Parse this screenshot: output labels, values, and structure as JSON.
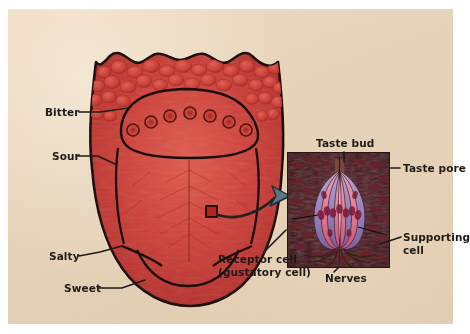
{
  "figure": {
    "panel_color": "#e6d3b9",
    "page_background": "#ffffff"
  },
  "tongue": {
    "name": "tongue-illustration",
    "body_color": "#cb3a34",
    "outline_color": "#1a0c09",
    "papillae_color": "#c94038",
    "marker": {
      "name": "sample-site-marker",
      "color": "#b7221e",
      "x": 211,
      "y": 211,
      "size": 11
    },
    "region_labels": [
      {
        "id": "bitter",
        "label": "Bitter",
        "x": 45,
        "y": 112,
        "leader_to_x": 128,
        "leader_to_y": 109
      },
      {
        "id": "sour",
        "label": "Sour",
        "x": 52,
        "y": 156,
        "leader_to_x": 116,
        "leader_to_y": 164
      },
      {
        "id": "salty",
        "label": "Salty",
        "x": 49,
        "y": 257,
        "leader_to_x": 121,
        "leader_to_y": 246
      },
      {
        "id": "sweet",
        "label": "Sweet",
        "x": 64,
        "y": 290,
        "leader_to_x": 143,
        "leader_to_y": 282
      }
    ]
  },
  "inset": {
    "name": "taste-bud-inset",
    "title": "Taste bud",
    "title_x": 316,
    "title_y": 137,
    "frame": {
      "x": 287,
      "y": 152,
      "width": 103,
      "height": 116
    },
    "background_color": "#3b1418",
    "border_color": "#2a1410",
    "cell_colors": {
      "receptor": "#e98aa0",
      "supporting": "#9b84bb",
      "nucleus": "#7c2040",
      "nerve": "#43221a"
    },
    "labels": [
      {
        "id": "taste-pore",
        "label": "Taste pore",
        "x": 403,
        "y": 164,
        "align": "left"
      },
      {
        "id": "supporting-cell",
        "label": "Supporting",
        "label2": "cell",
        "x": 403,
        "y": 233,
        "align": "left"
      },
      {
        "id": "receptor-cell",
        "label": "Receptor cell",
        "label2": "(gustatory cell)",
        "x": 218,
        "y": 259,
        "align": "left"
      },
      {
        "id": "nerves",
        "label": "Nerves",
        "x": 325,
        "y": 272,
        "align": "left"
      }
    ]
  },
  "connector": {
    "name": "magnification-arrow",
    "color": "#3d4f5c",
    "from_x": 216,
    "from_y": 214,
    "to_x": 286,
    "to_y": 196
  }
}
